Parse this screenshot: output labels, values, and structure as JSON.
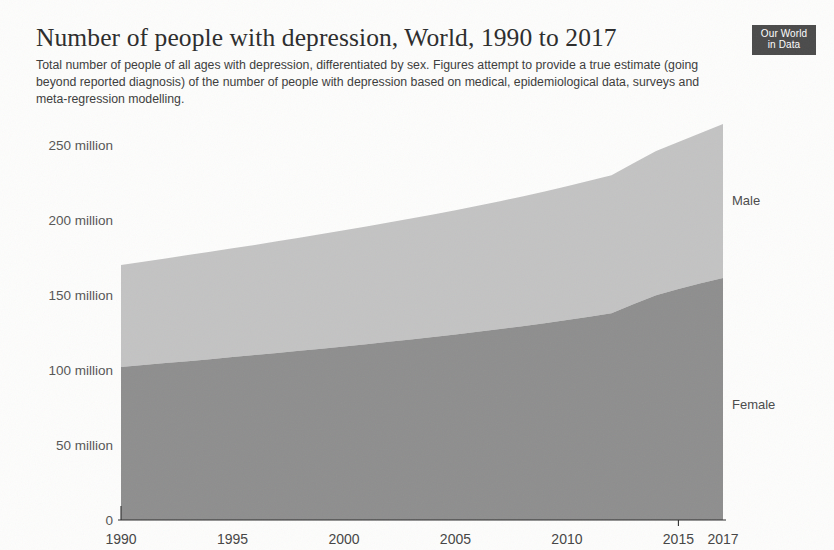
{
  "header": {
    "title": "Number of people with depression, World, 1990 to 2017",
    "subtitle": "Total number of people of all ages with depression, differentiated by sex. Figures attempt to provide a true estimate (going beyond reported diagnosis) of the number of people with depression based on medical, epidemiological data, surveys and meta-regression modelling."
  },
  "logo": {
    "line1": "Our World",
    "line2": "in Data"
  },
  "colors": {
    "male_band": "#c3c3c3",
    "female_band": "#8e8e8e",
    "axis": "#2b2b2b",
    "tick_text": "#555555",
    "background": "#fdfdfc",
    "logo_background": "#4a4a4a"
  },
  "axes": {
    "y_ticks": [
      "0",
      "50 million",
      "100 million",
      "150 million",
      "200 million",
      "250 million"
    ],
    "x_ticks": [
      "1990",
      "1995",
      "2000",
      "2005",
      "2010",
      "2015",
      "2017"
    ]
  },
  "series_labels": {
    "male": "Male",
    "female": "Female"
  },
  "chart_data": {
    "type": "area",
    "title": "Number of people with depression, World, 1990 to 2017",
    "subtitle": "Total number of people of all ages with depression, differentiated by sex. Figures attempt to provide a true estimate (going beyond reported diagnosis) of the number of people with depression based on medical, epidemiological data, surveys and meta-regression modelling.",
    "stacked": true,
    "xlabel": "",
    "ylabel": "",
    "xlim": [
      1990,
      2017
    ],
    "ylim": [
      0,
      275
    ],
    "y_unit": "million people",
    "y_tick_values": [
      0,
      50,
      100,
      150,
      200,
      250
    ],
    "y_tick_labels": [
      "0",
      "50 million",
      "100 million",
      "150 million",
      "200 million",
      "250 million"
    ],
    "x_tick_values": [
      1990,
      1995,
      2000,
      2005,
      2010,
      2015,
      2017
    ],
    "x_tick_labels": [
      "1990",
      "1995",
      "2000",
      "2005",
      "2010",
      "2015",
      "2017"
    ],
    "grid": false,
    "legend": "inline-right",
    "x": [
      1990,
      1991,
      1992,
      1993,
      1994,
      1995,
      1996,
      1997,
      1998,
      1999,
      2000,
      2001,
      2002,
      2003,
      2004,
      2005,
      2006,
      2007,
      2008,
      2009,
      2010,
      2011,
      2012,
      2013,
      2014,
      2015,
      2016,
      2017
    ],
    "series": [
      {
        "name": "Female",
        "color": "#8e8e8e",
        "stack_order": 1,
        "values": [
          102.0,
          103.3,
          104.6,
          105.9,
          107.2,
          108.6,
          110.0,
          111.4,
          112.8,
          114.2,
          115.7,
          117.2,
          118.8,
          120.4,
          122.0,
          123.7,
          125.5,
          127.3,
          129.2,
          131.2,
          133.3,
          135.5,
          137.8,
          144.0,
          149.8,
          154.0,
          157.8,
          161.3
        ]
      },
      {
        "name": "Male",
        "color": "#c3c3c3",
        "stack_order": 2,
        "values": [
          68.0,
          68.9,
          69.8,
          70.7,
          71.6,
          72.5,
          73.4,
          74.4,
          75.4,
          76.4,
          77.4,
          78.4,
          79.5,
          80.6,
          81.7,
          82.8,
          84.0,
          85.2,
          86.5,
          87.8,
          89.2,
          90.6,
          92.1,
          94.0,
          96.2,
          98.0,
          100.2,
          102.7
        ]
      }
    ],
    "totals": [
      170.0,
      172.2,
      174.4,
      176.6,
      178.8,
      181.1,
      183.4,
      185.8,
      188.2,
      190.6,
      193.1,
      195.6,
      198.3,
      201.0,
      203.7,
      206.5,
      209.5,
      212.5,
      215.7,
      219.0,
      222.5,
      226.1,
      229.9,
      238.0,
      246.0,
      252.0,
      258.0,
      264.0
    ]
  }
}
